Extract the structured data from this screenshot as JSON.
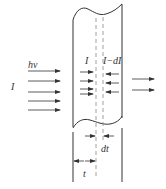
{
  "diagram": {
    "colors": {
      "stroke": "#333333",
      "dashed": "#888888",
      "background": "#ffffff"
    },
    "labels": {
      "photon_energy": "hν",
      "incident_intensity": "I",
      "intensity_at_layer": "I",
      "intensity_after_layer": "I−dI",
      "layer_thickness": "dt",
      "depth": "t"
    },
    "incident_arrows": {
      "count": 5,
      "direction": "right"
    },
    "layer_in_arrows": {
      "count": 4,
      "direction": "right"
    },
    "layer_out_arrows": {
      "count": 3,
      "direction": "left"
    },
    "transmitted_arrows": {
      "count": 2,
      "direction": "right"
    }
  }
}
